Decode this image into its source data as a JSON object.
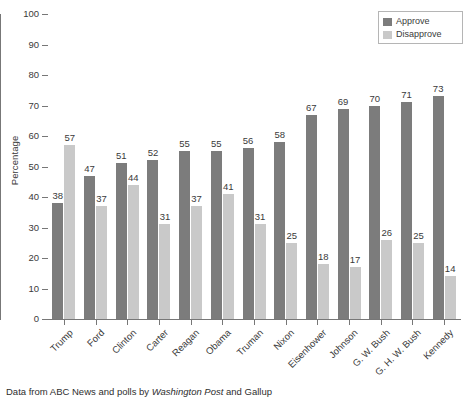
{
  "chart_data": {
    "type": "bar",
    "title": "",
    "xlabel": "",
    "ylabel": "Percentage",
    "ylim": [
      0,
      100
    ],
    "ytick_step": 10,
    "yticks": [
      100,
      90,
      80,
      70,
      60,
      50,
      40,
      30,
      20,
      10,
      0
    ],
    "grid": false,
    "legend_position": "top-right",
    "categories": [
      "Trump",
      "Ford",
      "Clinton",
      "Carter",
      "Reagan",
      "Obama",
      "Truman",
      "Nixon",
      "Eisenhower",
      "Johnson",
      "G. W. Bush",
      "G. H. W. Bush",
      "Kennedy"
    ],
    "series": [
      {
        "name": "Approve",
        "color": "#7c7c7c",
        "values": [
          38,
          47,
          51,
          52,
          55,
          55,
          56,
          58,
          67,
          69,
          70,
          71,
          73
        ]
      },
      {
        "name": "Disapprove",
        "color": "#c9c9c9",
        "values": [
          57,
          37,
          44,
          31,
          37,
          41,
          31,
          25,
          18,
          17,
          26,
          25,
          14
        ]
      }
    ]
  },
  "legend": {
    "entries": [
      {
        "label": "Approve",
        "color": "#7c7c7c"
      },
      {
        "label": "Disapprove",
        "color": "#c9c9c9"
      }
    ]
  },
  "caption": {
    "part1": "Data from ABC News and polls by ",
    "italic": "Washington Post",
    "part2": " and Gallup"
  }
}
